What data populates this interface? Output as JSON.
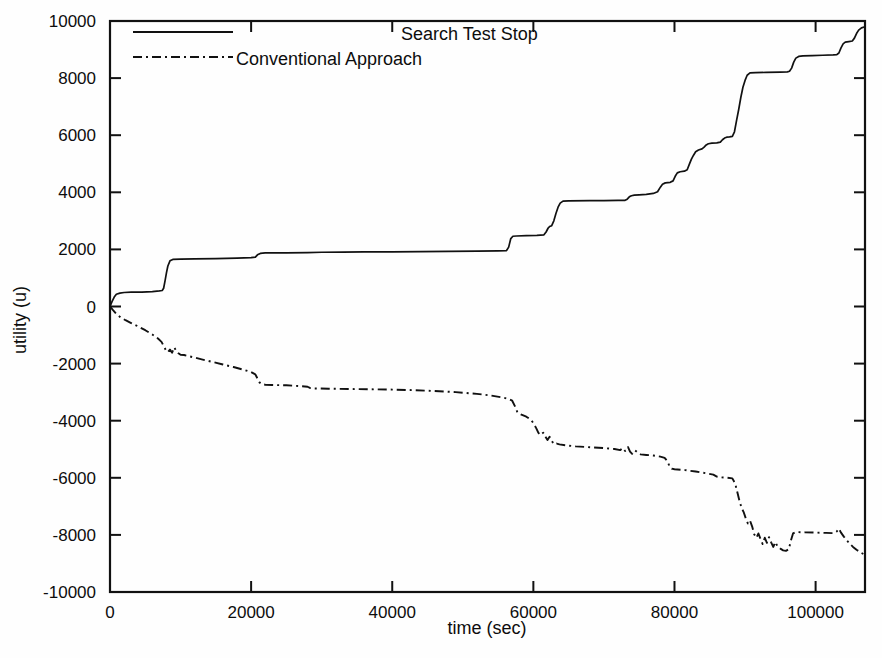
{
  "chart_data": {
    "type": "line",
    "title": "",
    "xlabel": "time (sec)",
    "ylabel": "utility (u)",
    "xlim": [
      0,
      107000
    ],
    "ylim": [
      -10000,
      10000
    ],
    "xticks": [
      0,
      20000,
      40000,
      60000,
      80000,
      100000
    ],
    "xtick_labels": [
      "0",
      "20000",
      "40000",
      "60000",
      "80000",
      "100000"
    ],
    "yticks": [
      -10000,
      -8000,
      -6000,
      -4000,
      -2000,
      0,
      2000,
      4000,
      6000,
      8000,
      10000
    ],
    "ytick_labels": [
      "-10000",
      "-8000",
      "-6000",
      "-4000",
      "-2000",
      "0",
      "2000",
      "4000",
      "6000",
      "8000",
      "10000"
    ],
    "grid": false,
    "legend_position": "top-center",
    "series": [
      {
        "name": "Search Test Stop",
        "style": "solid",
        "color": "#111111",
        "points": [
          [
            0,
            0
          ],
          [
            300,
            180
          ],
          [
            600,
            330
          ],
          [
            900,
            430
          ],
          [
            1400,
            470
          ],
          [
            2000,
            490
          ],
          [
            3000,
            500
          ],
          [
            4500,
            505
          ],
          [
            6000,
            520
          ],
          [
            7000,
            545
          ],
          [
            7400,
            560
          ],
          [
            7600,
            640
          ],
          [
            7800,
            900
          ],
          [
            8000,
            1180
          ],
          [
            8200,
            1420
          ],
          [
            8500,
            1600
          ],
          [
            8900,
            1650
          ],
          [
            10000,
            1660
          ],
          [
            12000,
            1670
          ],
          [
            15000,
            1680
          ],
          [
            18000,
            1695
          ],
          [
            20000,
            1710
          ],
          [
            20600,
            1730
          ],
          [
            20900,
            1810
          ],
          [
            21300,
            1860
          ],
          [
            22000,
            1875
          ],
          [
            25000,
            1880
          ],
          [
            28000,
            1890
          ],
          [
            30000,
            1900
          ],
          [
            33000,
            1905
          ],
          [
            36000,
            1910
          ],
          [
            40000,
            1915
          ],
          [
            44000,
            1920
          ],
          [
            48000,
            1930
          ],
          [
            52000,
            1940
          ],
          [
            55000,
            1950
          ],
          [
            56200,
            1960
          ],
          [
            56500,
            2080
          ],
          [
            56800,
            2380
          ],
          [
            57100,
            2460
          ],
          [
            57600,
            2470
          ],
          [
            59000,
            2480
          ],
          [
            60500,
            2490
          ],
          [
            61500,
            2510
          ],
          [
            61800,
            2610
          ],
          [
            62100,
            2750
          ],
          [
            62300,
            2800
          ],
          [
            62600,
            2830
          ],
          [
            62900,
            3000
          ],
          [
            63200,
            3260
          ],
          [
            63500,
            3480
          ],
          [
            63800,
            3620
          ],
          [
            64200,
            3690
          ],
          [
            65000,
            3700
          ],
          [
            68000,
            3705
          ],
          [
            70000,
            3710
          ],
          [
            72000,
            3715
          ],
          [
            73000,
            3720
          ],
          [
            73300,
            3760
          ],
          [
            73600,
            3840
          ],
          [
            73900,
            3880
          ],
          [
            74300,
            3900
          ],
          [
            75000,
            3910
          ],
          [
            76000,
            3930
          ],
          [
            77000,
            3960
          ],
          [
            77600,
            4020
          ],
          [
            78000,
            4180
          ],
          [
            78300,
            4280
          ],
          [
            78700,
            4330
          ],
          [
            79400,
            4350
          ],
          [
            79800,
            4400
          ],
          [
            80100,
            4560
          ],
          [
            80400,
            4680
          ],
          [
            80800,
            4720
          ],
          [
            81400,
            4740
          ],
          [
            81800,
            4790
          ],
          [
            82100,
            4980
          ],
          [
            82400,
            5160
          ],
          [
            82700,
            5300
          ],
          [
            83000,
            5420
          ],
          [
            83400,
            5480
          ],
          [
            83900,
            5520
          ],
          [
            84200,
            5580
          ],
          [
            84500,
            5660
          ],
          [
            84800,
            5700
          ],
          [
            85300,
            5720
          ],
          [
            86000,
            5730
          ],
          [
            86500,
            5760
          ],
          [
            86800,
            5840
          ],
          [
            87100,
            5900
          ],
          [
            87400,
            5930
          ],
          [
            87800,
            5940
          ],
          [
            88200,
            5960
          ],
          [
            88500,
            6120
          ],
          [
            88800,
            6520
          ],
          [
            89100,
            6900
          ],
          [
            89400,
            7320
          ],
          [
            89700,
            7680
          ],
          [
            90000,
            7920
          ],
          [
            90300,
            8100
          ],
          [
            90700,
            8180
          ],
          [
            91500,
            8190
          ],
          [
            93000,
            8200
          ],
          [
            95000,
            8210
          ],
          [
            96000,
            8220
          ],
          [
            96300,
            8240
          ],
          [
            96600,
            8350
          ],
          [
            96900,
            8560
          ],
          [
            97200,
            8700
          ],
          [
            97600,
            8760
          ],
          [
            98200,
            8780
          ],
          [
            99500,
            8790
          ],
          [
            101000,
            8800
          ],
          [
            102500,
            8810
          ],
          [
            103000,
            8820
          ],
          [
            103300,
            8880
          ],
          [
            103600,
            9060
          ],
          [
            103900,
            9200
          ],
          [
            104200,
            9260
          ],
          [
            104700,
            9280
          ],
          [
            105200,
            9300
          ],
          [
            105500,
            9400
          ],
          [
            105800,
            9560
          ],
          [
            106100,
            9680
          ],
          [
            106500,
            9760
          ],
          [
            107000,
            9800
          ]
        ]
      },
      {
        "name": "Conventional Approach",
        "style": "dash-dot",
        "color": "#111111",
        "points": [
          [
            0,
            0
          ],
          [
            400,
            -120
          ],
          [
            900,
            -260
          ],
          [
            1500,
            -380
          ],
          [
            2200,
            -480
          ],
          [
            3000,
            -580
          ],
          [
            4000,
            -700
          ],
          [
            5000,
            -830
          ],
          [
            6000,
            -980
          ],
          [
            6800,
            -1120
          ],
          [
            7300,
            -1240
          ],
          [
            7600,
            -1380
          ],
          [
            7900,
            -1520
          ],
          [
            8200,
            -1600
          ],
          [
            8500,
            -1510
          ],
          [
            8800,
            -1620
          ],
          [
            9100,
            -1430
          ],
          [
            9400,
            -1560
          ],
          [
            9700,
            -1640
          ],
          [
            10000,
            -1690
          ],
          [
            10500,
            -1700
          ],
          [
            11500,
            -1760
          ],
          [
            13000,
            -1850
          ],
          [
            14500,
            -1940
          ],
          [
            16000,
            -2030
          ],
          [
            17500,
            -2120
          ],
          [
            19000,
            -2220
          ],
          [
            20000,
            -2300
          ],
          [
            20600,
            -2380
          ],
          [
            20900,
            -2520
          ],
          [
            21200,
            -2660
          ],
          [
            21500,
            -2720
          ],
          [
            22000,
            -2740
          ],
          [
            23000,
            -2750
          ],
          [
            25000,
            -2760
          ],
          [
            27000,
            -2790
          ],
          [
            28000,
            -2810
          ],
          [
            28400,
            -2860
          ],
          [
            29000,
            -2870
          ],
          [
            31000,
            -2880
          ],
          [
            34000,
            -2890
          ],
          [
            37000,
            -2900
          ],
          [
            40000,
            -2910
          ],
          [
            43000,
            -2930
          ],
          [
            46000,
            -2960
          ],
          [
            49000,
            -3000
          ],
          [
            52000,
            -3060
          ],
          [
            54000,
            -3120
          ],
          [
            55500,
            -3180
          ],
          [
            56500,
            -3240
          ],
          [
            57000,
            -3300
          ],
          [
            57400,
            -3500
          ],
          [
            57700,
            -3680
          ],
          [
            58000,
            -3760
          ],
          [
            58400,
            -3800
          ],
          [
            59000,
            -3860
          ],
          [
            59600,
            -3960
          ],
          [
            60000,
            -4080
          ],
          [
            60400,
            -4260
          ],
          [
            60700,
            -4420
          ],
          [
            61000,
            -4500
          ],
          [
            61400,
            -4420
          ],
          [
            61700,
            -4560
          ],
          [
            62000,
            -4680
          ],
          [
            62300,
            -4560
          ],
          [
            62600,
            -4700
          ],
          [
            62900,
            -4820
          ],
          [
            63300,
            -4800
          ],
          [
            63700,
            -4830
          ],
          [
            64500,
            -4860
          ],
          [
            66000,
            -4900
          ],
          [
            68000,
            -4930
          ],
          [
            70000,
            -4960
          ],
          [
            71500,
            -4990
          ],
          [
            72300,
            -5030
          ],
          [
            72700,
            -4960
          ],
          [
            73000,
            -5060
          ],
          [
            73400,
            -4920
          ],
          [
            73700,
            -5080
          ],
          [
            74000,
            -5160
          ],
          [
            74400,
            -5040
          ],
          [
            74800,
            -5120
          ],
          [
            75200,
            -5180
          ],
          [
            76000,
            -5200
          ],
          [
            77000,
            -5220
          ],
          [
            78000,
            -5260
          ],
          [
            78600,
            -5300
          ],
          [
            79000,
            -5420
          ],
          [
            79300,
            -5600
          ],
          [
            79600,
            -5680
          ],
          [
            80000,
            -5700
          ],
          [
            81500,
            -5730
          ],
          [
            83000,
            -5780
          ],
          [
            84500,
            -5840
          ],
          [
            85500,
            -5890
          ],
          [
            86000,
            -5960
          ],
          [
            86500,
            -5980
          ],
          [
            87500,
            -6000
          ],
          [
            88200,
            -6020
          ],
          [
            88600,
            -6200
          ],
          [
            88900,
            -6500
          ],
          [
            89200,
            -6800
          ],
          [
            89500,
            -7050
          ],
          [
            89800,
            -7200
          ],
          [
            90100,
            -7420
          ],
          [
            90400,
            -7600
          ],
          [
            90700,
            -7500
          ],
          [
            91000,
            -7700
          ],
          [
            91300,
            -7980
          ],
          [
            91600,
            -8100
          ],
          [
            91900,
            -7950
          ],
          [
            92200,
            -8150
          ],
          [
            92500,
            -8320
          ],
          [
            92800,
            -8100
          ],
          [
            93100,
            -8280
          ],
          [
            93400,
            -8080
          ],
          [
            93700,
            -8260
          ],
          [
            94000,
            -8420
          ],
          [
            94300,
            -8250
          ],
          [
            94600,
            -8400
          ],
          [
            95000,
            -8480
          ],
          [
            95400,
            -8540
          ],
          [
            95800,
            -8560
          ],
          [
            96200,
            -8500
          ],
          [
            96500,
            -8200
          ],
          [
            96800,
            -7950
          ],
          [
            97200,
            -7900
          ],
          [
            98500,
            -7910
          ],
          [
            100000,
            -7920
          ],
          [
            101500,
            -7930
          ],
          [
            102500,
            -7940
          ],
          [
            103000,
            -7880
          ],
          [
            103300,
            -7780
          ],
          [
            103600,
            -7920
          ],
          [
            104000,
            -8060
          ],
          [
            104400,
            -8180
          ],
          [
            104800,
            -8300
          ],
          [
            105300,
            -8420
          ],
          [
            105800,
            -8520
          ],
          [
            106400,
            -8620
          ],
          [
            107000,
            -8700
          ]
        ]
      }
    ]
  },
  "plot_geometry": {
    "left": 110,
    "right": 865,
    "top": 21,
    "bottom": 592
  },
  "legend": {
    "entries": [
      {
        "label": "Search Test Stop",
        "style": "solid"
      },
      {
        "label": "Conventional Approach",
        "style": "dash-dot"
      }
    ]
  }
}
